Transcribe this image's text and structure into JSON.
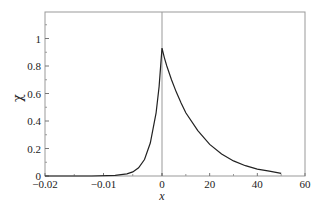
{
  "chart_data": {
    "type": "line",
    "title": "",
    "xlabel": "x",
    "ylabel": "χ",
    "ylim": [
      0,
      1.2
    ],
    "grid": false,
    "legend": null,
    "note": "Split x-axis: left segment linear from -0.02 to 0, right segment linear from 0 to 60; vertical divider line at x=0.",
    "x_segments": [
      {
        "range": [
          -0.02,
          0
        ],
        "ticks": [
          -0.02,
          -0.01,
          0
        ],
        "tick_labels": [
          "−0.02",
          "−0.01",
          "0"
        ]
      },
      {
        "range": [
          0,
          60
        ],
        "ticks": [
          0,
          20,
          40,
          60
        ],
        "tick_labels": [
          "0",
          "20",
          "40",
          "60"
        ]
      }
    ],
    "y_ticks": [
      0,
      0.2,
      0.4,
      0.6,
      0.8,
      1
    ],
    "y_tick_labels": [
      "0",
      "0.2",
      "0.4",
      "0.6",
      "0.8",
      "1"
    ],
    "series": [
      {
        "name": "chi",
        "left_x": [
          -0.02,
          -0.012,
          -0.008,
          -0.006,
          -0.005,
          -0.004,
          -0.003,
          -0.002,
          -0.001,
          -0.0005,
          0
        ],
        "left_y": [
          0.0,
          0.0,
          0.005,
          0.015,
          0.03,
          0.06,
          0.12,
          0.24,
          0.46,
          0.65,
          0.93
        ],
        "right_x": [
          0,
          1,
          2,
          4,
          6,
          8,
          10,
          15,
          20,
          25,
          30,
          35,
          40,
          45,
          50
        ],
        "right_y": [
          0.93,
          0.86,
          0.8,
          0.7,
          0.61,
          0.53,
          0.46,
          0.33,
          0.23,
          0.16,
          0.11,
          0.075,
          0.05,
          0.035,
          0.02
        ]
      }
    ]
  }
}
